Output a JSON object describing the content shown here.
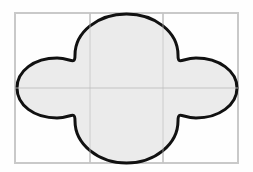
{
  "figure": {
    "canvas": {
      "width": 253,
      "height": 172,
      "background": "#fefefe"
    },
    "frame": {
      "name": "bounding-rectangle",
      "x": 15,
      "y": 13,
      "width": 223,
      "height": 150,
      "stroke": "#c9c9c9",
      "stroke_width": 2,
      "fill": "none"
    },
    "grid": {
      "columns": 3,
      "rows": 2,
      "stroke": "#c9c9c9",
      "stroke_width": 1.5,
      "vertical_lines_x": [
        90,
        163
      ],
      "horizontal_lines_y": [
        88
      ]
    },
    "shape": {
      "name": "four-lobed-cross",
      "fill": "#ebebeb",
      "stroke": "#111111",
      "stroke_width": 3,
      "center": {
        "x": 126.5,
        "y": 88
      },
      "extents": {
        "left": 17,
        "right": 237,
        "top": 14,
        "bottom": 163
      },
      "lobes": [
        {
          "direction": "top",
          "tip_x": 126.5,
          "tip_y": 14,
          "half_width": 52
        },
        {
          "direction": "bottom",
          "tip_x": 126.5,
          "tip_y": 163,
          "half_width": 52
        },
        {
          "direction": "left",
          "tip_x": 17,
          "tip_y": 88,
          "half_height": 30
        },
        {
          "direction": "right",
          "tip_x": 237,
          "tip_y": 88,
          "half_height": 30
        }
      ],
      "path": "M 126.5 14 C 155 14 178 32 178 55 C 178 66 182 58 196 58 C 219 58 237 71 237 88 C 237 105 219 118 196 118 C 182 118 178 110 178 121 C 178 144 155 163 126.5 163 C 98 163 75 144 75 121 C 75 110 71 118 57 118 C 34 118 17 105 17 88 C 17 71 34 58 57 58 C 71 58 75 66 75 55 C 75 32 98 14 126.5 14 Z"
    }
  }
}
